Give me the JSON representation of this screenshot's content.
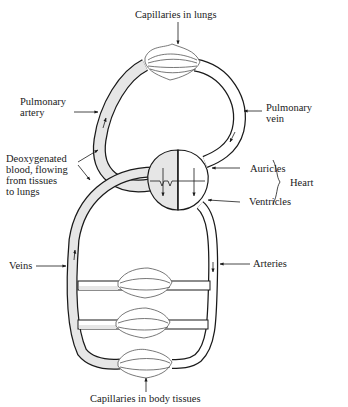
{
  "diagram": {
    "type": "circulatory-system",
    "labels": {
      "capillaries_lungs": "Capillaries in lungs",
      "pulmonary_artery_1": "Pulmonary",
      "pulmonary_artery_2": "artery",
      "pulmonary_vein_1": "Pulmonary",
      "pulmonary_vein_2": "vein",
      "deoxy_1": "Deoxygenated",
      "deoxy_2": "blood, flowing",
      "deoxy_3": "from tissues",
      "deoxy_4": "to lungs",
      "auricles": "Auricles",
      "ventricles": "Ventricles",
      "heart": "Heart",
      "veins": "Veins",
      "arteries": "Arteries",
      "capillaries_body": "Capillaries in body tissues"
    },
    "colors": {
      "line": "#1a1a1a",
      "deoxygenated_fill": "#e6e6e6",
      "oxygenated_fill": "#ffffff"
    }
  }
}
